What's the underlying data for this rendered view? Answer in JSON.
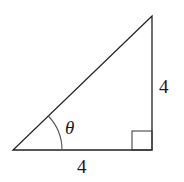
{
  "diagram": {
    "type": "right-triangle",
    "angle_label": "θ",
    "bottom_side_label": "4",
    "right_side_label": "4",
    "right_angle_marker": true,
    "colors": {
      "stroke": "#222222",
      "arc": "#555555",
      "text": "#1a1a1a"
    }
  }
}
